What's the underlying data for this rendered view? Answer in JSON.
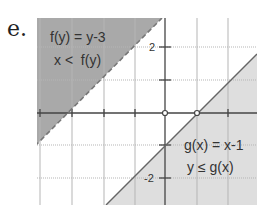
{
  "problem_label": "e.",
  "graph": {
    "region1": {
      "function": "f(y) = y-3",
      "inequality": "x <  f(y)",
      "boundary_style": "dashed",
      "shaded": "left/above"
    },
    "region2": {
      "function": "g(x) = x-1",
      "inequality": "y ≤ g(x)",
      "boundary_style": "solid",
      "shaded": "right/below"
    },
    "y_ticks": [
      "2",
      "-2"
    ],
    "points": [
      {
        "x": 0,
        "y": 0,
        "style": "open"
      },
      {
        "x": 1,
        "y": 0,
        "style": "open"
      }
    ],
    "colors": {
      "dark_shade": "#a9a9a9",
      "light_shade": "#dcdcdc",
      "grid": "#b0b0b0",
      "axis": "#444444"
    }
  }
}
